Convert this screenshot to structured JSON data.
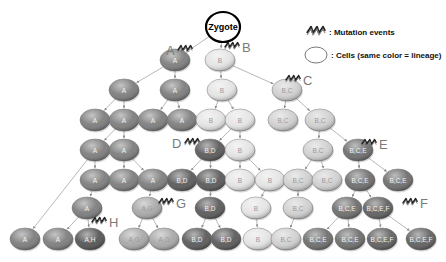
{
  "zygote": {
    "label": "Zygote",
    "x": 223,
    "y": 27
  },
  "legend": {
    "mutation_label": ": Mutation events",
    "cell_label": ": Cells (same color = lineage)"
  },
  "lineage_colors": {
    "A": "#7d7d7d",
    "AH": "#555555",
    "AG": "#a8a8a8",
    "B": "#e4e4e4",
    "BC": "#d0d0d0",
    "BD": "#5a5a5a",
    "BCE": "#6e6e6e",
    "BCEF": "#606060"
  },
  "mutations": [
    {
      "label": "A",
      "x": 196,
      "y": 50
    },
    {
      "label": "B",
      "x": 240,
      "y": 47
    },
    {
      "label": "C",
      "x": 301,
      "y": 80
    },
    {
      "label": "D",
      "x": 176,
      "y": 143
    },
    {
      "label": "E",
      "x": 377,
      "y": 144
    },
    {
      "label": "G",
      "x": 174,
      "y": 203
    },
    {
      "label": "F",
      "x": 418,
      "y": 203
    },
    {
      "label": "H",
      "x": 107,
      "y": 222
    }
  ],
  "cells": [
    {
      "id": "c1",
      "label": "A",
      "lineage": "A",
      "x": 175,
      "y": 60
    },
    {
      "id": "c2",
      "label": "B",
      "lineage": "B",
      "x": 220,
      "y": 60
    },
    {
      "id": "c3",
      "label": "A",
      "lineage": "A",
      "x": 124,
      "y": 90
    },
    {
      "id": "c4",
      "label": "A",
      "lineage": "A",
      "x": 175,
      "y": 90
    },
    {
      "id": "c5",
      "label": "B",
      "lineage": "B",
      "x": 222,
      "y": 90
    },
    {
      "id": "c6",
      "label": "B,C",
      "lineage": "BC",
      "x": 287,
      "y": 90
    },
    {
      "id": "c7",
      "label": "A",
      "lineage": "A",
      "x": 95,
      "y": 120
    },
    {
      "id": "c8",
      "label": "A",
      "lineage": "A",
      "x": 124,
      "y": 120
    },
    {
      "id": "c9",
      "label": "A",
      "lineage": "A",
      "x": 153,
      "y": 120
    },
    {
      "id": "c10",
      "label": "A",
      "lineage": "A",
      "x": 182,
      "y": 120
    },
    {
      "id": "c11",
      "label": "B",
      "lineage": "B",
      "x": 211,
      "y": 120
    },
    {
      "id": "c12",
      "label": "B",
      "lineage": "B",
      "x": 240,
      "y": 120
    },
    {
      "id": "c13",
      "label": "B,C",
      "lineage": "BC",
      "x": 283,
      "y": 120
    },
    {
      "id": "c14",
      "label": "B,C",
      "lineage": "BC",
      "x": 320,
      "y": 120
    },
    {
      "id": "c15",
      "label": "A",
      "lineage": "A",
      "x": 95,
      "y": 150
    },
    {
      "id": "c16",
      "label": "A",
      "lineage": "A",
      "x": 124,
      "y": 150
    },
    {
      "id": "c17",
      "label": "B,D",
      "lineage": "BD",
      "x": 210,
      "y": 150
    },
    {
      "id": "c18",
      "label": "B",
      "lineage": "B",
      "x": 240,
      "y": 150
    },
    {
      "id": "c19",
      "label": "B,C",
      "lineage": "BC",
      "x": 318,
      "y": 150
    },
    {
      "id": "c20",
      "label": "B,C,E",
      "lineage": "BCE",
      "x": 358,
      "y": 150
    },
    {
      "id": "c21",
      "label": "A",
      "lineage": "A",
      "x": 95,
      "y": 180
    },
    {
      "id": "c22",
      "label": "A",
      "lineage": "A",
      "x": 124,
      "y": 180
    },
    {
      "id": "c23",
      "label": "A",
      "lineage": "A",
      "x": 153,
      "y": 180
    },
    {
      "id": "c24",
      "label": "B,D",
      "lineage": "BD",
      "x": 182,
      "y": 180
    },
    {
      "id": "c25",
      "label": "B,D",
      "lineage": "BD",
      "x": 211,
      "y": 180
    },
    {
      "id": "c26",
      "label": "B",
      "lineage": "B",
      "x": 240,
      "y": 180
    },
    {
      "id": "c27",
      "label": "B",
      "lineage": "B",
      "x": 270,
      "y": 180
    },
    {
      "id": "c28",
      "label": "B,C",
      "lineage": "BC",
      "x": 298,
      "y": 180
    },
    {
      "id": "c29",
      "label": "B,C",
      "lineage": "BC",
      "x": 327,
      "y": 180
    },
    {
      "id": "c30",
      "label": "B,C,E",
      "lineage": "BCE",
      "x": 360,
      "y": 180
    },
    {
      "id": "c31",
      "label": "B,C,E",
      "lineage": "BCE",
      "x": 398,
      "y": 180
    },
    {
      "id": "c32",
      "label": "A",
      "lineage": "A",
      "x": 87,
      "y": 208
    },
    {
      "id": "c33",
      "label": "A,G",
      "lineage": "AG",
      "x": 147,
      "y": 208
    },
    {
      "id": "c34",
      "label": "B,D",
      "lineage": "BD",
      "x": 210,
      "y": 208
    },
    {
      "id": "c35",
      "label": "B",
      "lineage": "B",
      "x": 256,
      "y": 208
    },
    {
      "id": "c36",
      "label": "B,C",
      "lineage": "BC",
      "x": 298,
      "y": 208
    },
    {
      "id": "c37",
      "label": "B,C,E",
      "lineage": "BCE",
      "x": 347,
      "y": 208
    },
    {
      "id": "c38",
      "label": "B,C,E,F",
      "lineage": "BCEF",
      "x": 378,
      "y": 208
    },
    {
      "id": "c39",
      "label": "A",
      "lineage": "A",
      "x": 25,
      "y": 239
    },
    {
      "id": "c40",
      "label": "A",
      "lineage": "A",
      "x": 58,
      "y": 239
    },
    {
      "id": "c41",
      "label": "A,H",
      "lineage": "AH",
      "x": 90,
      "y": 239
    },
    {
      "id": "c42",
      "label": "A,G",
      "lineage": "AG",
      "x": 134,
      "y": 239
    },
    {
      "id": "c43",
      "label": "A,G",
      "lineage": "AG",
      "x": 164,
      "y": 239
    },
    {
      "id": "c44",
      "label": "B,D",
      "lineage": "BD",
      "x": 197,
      "y": 239
    },
    {
      "id": "c45",
      "label": "B,D",
      "lineage": "BD",
      "x": 226,
      "y": 239
    },
    {
      "id": "c46",
      "label": "B",
      "lineage": "B",
      "x": 258,
      "y": 239
    },
    {
      "id": "c47",
      "label": "B,C",
      "lineage": "BC",
      "x": 286,
      "y": 239
    },
    {
      "id": "c48",
      "label": "B,C,E",
      "lineage": "BCE",
      "x": 318,
      "y": 239
    },
    {
      "id": "c49",
      "label": "B,C,E",
      "lineage": "BCE",
      "x": 350,
      "y": 239
    },
    {
      "id": "c50",
      "label": "B,C,E,F",
      "lineage": "BCEF",
      "x": 382,
      "y": 239
    },
    {
      "id": "c51",
      "label": "B,C,E,F",
      "lineage": "BCEF",
      "x": 421,
      "y": 239
    }
  ],
  "edges": [
    [
      "zygote",
      "c1"
    ],
    [
      "zygote",
      "c2"
    ],
    [
      "c1",
      "c3"
    ],
    [
      "c1",
      "c4"
    ],
    [
      "c2",
      "c5"
    ],
    [
      "c2",
      "c6"
    ],
    [
      "c3",
      "c7"
    ],
    [
      "c3",
      "c8"
    ],
    [
      "c4",
      "c9"
    ],
    [
      "c4",
      "c10"
    ],
    [
      "c5",
      "c11"
    ],
    [
      "c5",
      "c12"
    ],
    [
      "c6",
      "c13"
    ],
    [
      "c6",
      "c14"
    ],
    [
      "c8",
      "c15"
    ],
    [
      "c8",
      "c16"
    ],
    [
      "c12",
      "c17"
    ],
    [
      "c12",
      "c18"
    ],
    [
      "c14",
      "c19"
    ],
    [
      "c14",
      "c20"
    ],
    [
      "c15",
      "c39"
    ],
    [
      "c15",
      "c21"
    ],
    [
      "c16",
      "c22"
    ],
    [
      "c16",
      "c23"
    ],
    [
      "c17",
      "c24"
    ],
    [
      "c17",
      "c25"
    ],
    [
      "c18",
      "c26"
    ],
    [
      "c18",
      "c27"
    ],
    [
      "c19",
      "c28"
    ],
    [
      "c19",
      "c29"
    ],
    [
      "c20",
      "c30"
    ],
    [
      "c20",
      "c31"
    ],
    [
      "c21",
      "c32"
    ],
    [
      "c23",
      "c33"
    ],
    [
      "c25",
      "c34"
    ],
    [
      "c27",
      "c35"
    ],
    [
      "c28",
      "c36"
    ],
    [
      "c30",
      "c37"
    ],
    [
      "c30",
      "c38"
    ],
    [
      "c32",
      "c40"
    ],
    [
      "c32",
      "c41"
    ],
    [
      "c33",
      "c42"
    ],
    [
      "c33",
      "c43"
    ],
    [
      "c34",
      "c44"
    ],
    [
      "c34",
      "c45"
    ],
    [
      "c35",
      "c46"
    ],
    [
      "c36",
      "c47"
    ],
    [
      "c37",
      "c48"
    ],
    [
      "c37",
      "c49"
    ],
    [
      "c38",
      "c50"
    ],
    [
      "c38",
      "c51"
    ]
  ]
}
